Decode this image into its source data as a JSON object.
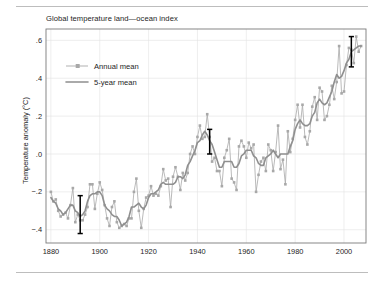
{
  "figure": {
    "title": "Global temperature land—ocean index",
    "ylabel": "Temperature anomaly (°C)",
    "rule_color": "#bdbdbd"
  },
  "legend": {
    "position": "upper-left-inside",
    "entries": [
      {
        "label": "Annual mean",
        "style": "line-with-square-markers",
        "color": "#a8a8a8"
      },
      {
        "label": "5-year mean",
        "style": "line",
        "color": "#8f8f8f"
      }
    ]
  },
  "axes": {
    "x_ticks": [
      "1880",
      "1900",
      "1920",
      "1940",
      "1960",
      "1980",
      "2000"
    ],
    "y_ticks": [
      ".6",
      ".4",
      ".2",
      ".0",
      "−.2",
      "−.4"
    ],
    "xlim": [
      1878,
      2009
    ],
    "ylim": [
      -0.47,
      0.66
    ],
    "grid": true,
    "grid_color": "#e3e3e3",
    "frame_color": "#7a7a7a"
  },
  "chart_data": {
    "type": "line",
    "title": "Global temperature land—ocean index",
    "xlabel": "",
    "ylabel": "Temperature anomaly (°C)",
    "xlim": [
      1878,
      2009
    ],
    "ylim": [
      -0.47,
      0.66
    ],
    "grid": true,
    "legend_position": "upper left",
    "x": [
      1880,
      1881,
      1882,
      1883,
      1884,
      1885,
      1886,
      1887,
      1888,
      1889,
      1890,
      1891,
      1892,
      1893,
      1894,
      1895,
      1896,
      1897,
      1898,
      1899,
      1900,
      1901,
      1902,
      1903,
      1904,
      1905,
      1906,
      1907,
      1908,
      1909,
      1910,
      1911,
      1912,
      1913,
      1914,
      1915,
      1916,
      1917,
      1918,
      1919,
      1920,
      1921,
      1922,
      1923,
      1924,
      1925,
      1926,
      1927,
      1928,
      1929,
      1930,
      1931,
      1932,
      1933,
      1934,
      1935,
      1936,
      1937,
      1938,
      1939,
      1940,
      1941,
      1942,
      1943,
      1944,
      1945,
      1946,
      1947,
      1948,
      1949,
      1950,
      1951,
      1952,
      1953,
      1954,
      1955,
      1956,
      1957,
      1958,
      1959,
      1960,
      1961,
      1962,
      1963,
      1964,
      1965,
      1966,
      1967,
      1968,
      1969,
      1970,
      1971,
      1972,
      1973,
      1974,
      1975,
      1976,
      1977,
      1978,
      1979,
      1980,
      1981,
      1982,
      1983,
      1984,
      1985,
      1986,
      1987,
      1988,
      1989,
      1990,
      1991,
      1992,
      1993,
      1994,
      1995,
      1996,
      1997,
      1998,
      1999,
      2000,
      2001,
      2002,
      2003,
      2004,
      2005,
      2006,
      2007
    ],
    "series": [
      {
        "name": "Annual mean",
        "color": "#a8a8a8",
        "marker": "square",
        "values": [
          -0.2,
          -0.25,
          -0.24,
          -0.3,
          -0.33,
          -0.32,
          -0.31,
          -0.34,
          -0.27,
          -0.18,
          -0.36,
          -0.32,
          -0.35,
          -0.35,
          -0.32,
          -0.28,
          -0.16,
          -0.16,
          -0.29,
          -0.21,
          -0.15,
          -0.19,
          -0.27,
          -0.34,
          -0.38,
          -0.28,
          -0.25,
          -0.36,
          -0.39,
          -0.38,
          -0.37,
          -0.38,
          -0.34,
          -0.34,
          -0.2,
          -0.13,
          -0.3,
          -0.39,
          -0.29,
          -0.23,
          -0.22,
          -0.17,
          -0.22,
          -0.21,
          -0.22,
          -0.17,
          -0.08,
          -0.14,
          -0.13,
          -0.28,
          -0.12,
          -0.07,
          -0.12,
          -0.19,
          -0.1,
          -0.14,
          -0.1,
          0.0,
          0.04,
          0.0,
          0.09,
          0.15,
          0.08,
          0.09,
          0.21,
          0.09,
          -0.04,
          -0.02,
          -0.09,
          -0.09,
          -0.17,
          -0.02,
          0.02,
          0.08,
          -0.13,
          -0.15,
          -0.19,
          0.04,
          0.07,
          0.04,
          -0.02,
          0.06,
          0.03,
          0.05,
          -0.2,
          -0.11,
          -0.04,
          -0.02,
          -0.09,
          0.05,
          0.02,
          -0.09,
          0.01,
          0.15,
          -0.08,
          -0.03,
          -0.16,
          0.12,
          0.01,
          0.08,
          0.18,
          0.26,
          0.14,
          0.26,
          0.09,
          0.05,
          0.12,
          0.25,
          0.3,
          0.18,
          0.35,
          0.33,
          0.18,
          0.2,
          0.26,
          0.36,
          0.29,
          0.38,
          0.57,
          0.32,
          0.33,
          0.47,
          0.56,
          0.55,
          0.48,
          0.62,
          0.54,
          0.57
        ]
      },
      {
        "name": "5-year mean",
        "color": "#8f8f8f",
        "marker": "none",
        "values": [
          -0.23,
          -0.25,
          -0.26,
          -0.29,
          -0.3,
          -0.32,
          -0.31,
          -0.29,
          -0.27,
          -0.27,
          -0.3,
          -0.31,
          -0.33,
          -0.32,
          -0.3,
          -0.25,
          -0.22,
          -0.21,
          -0.21,
          -0.2,
          -0.2,
          -0.22,
          -0.27,
          -0.29,
          -0.3,
          -0.32,
          -0.33,
          -0.33,
          -0.35,
          -0.38,
          -0.37,
          -0.36,
          -0.33,
          -0.28,
          -0.28,
          -0.27,
          -0.26,
          -0.28,
          -0.29,
          -0.27,
          -0.23,
          -0.21,
          -0.21,
          -0.2,
          -0.19,
          -0.16,
          -0.15,
          -0.16,
          -0.16,
          -0.16,
          -0.16,
          -0.15,
          -0.12,
          -0.12,
          -0.13,
          -0.11,
          -0.06,
          -0.04,
          -0.01,
          0.02,
          0.06,
          0.07,
          0.1,
          0.12,
          0.1,
          0.07,
          0.05,
          0.01,
          -0.03,
          -0.07,
          -0.07,
          -0.04,
          -0.04,
          -0.04,
          -0.04,
          -0.07,
          -0.07,
          -0.05,
          -0.01,
          0.0,
          0.02,
          0.02,
          0.02,
          -0.01,
          -0.02,
          -0.05,
          -0.06,
          -0.06,
          -0.02,
          -0.01,
          0.0,
          0.02,
          0.0,
          -0.02,
          0.0,
          0.0,
          0.0,
          0.0,
          0.04,
          0.07,
          0.13,
          0.16,
          0.18,
          0.16,
          0.15,
          0.15,
          0.16,
          0.2,
          0.22,
          0.27,
          0.29,
          0.27,
          0.26,
          0.27,
          0.3,
          0.33,
          0.38,
          0.42,
          0.4,
          0.41,
          0.44,
          0.48,
          0.5,
          0.54,
          0.55,
          0.56,
          0.57,
          0.57
        ]
      }
    ],
    "error_bars": [
      {
        "x": 1892,
        "low": -0.42,
        "high": -0.22,
        "color": "#000000"
      },
      {
        "x": 1945,
        "low": 0.0,
        "high": 0.13,
        "color": "#000000"
      },
      {
        "x": 2003,
        "low": 0.46,
        "high": 0.62,
        "color": "#000000"
      }
    ]
  }
}
